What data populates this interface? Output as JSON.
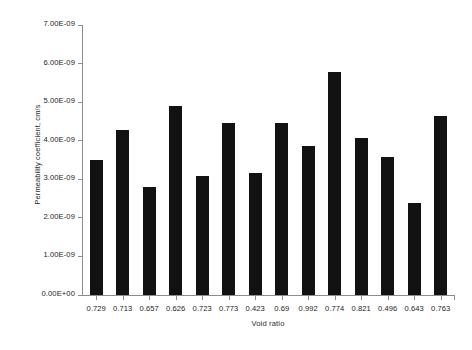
{
  "chart_data": {
    "type": "bar",
    "title": "",
    "xlabel": "Void ratio",
    "ylabel": "Permeability coefficient, cm/s",
    "categories": [
      "0.729",
      "0.713",
      "0.657",
      "0.626",
      "0.723",
      "0.773",
      "0.423",
      "0.69",
      "0.992",
      "0.774",
      "0.821",
      "0.496",
      "0.643",
      "0.763"
    ],
    "values": [
      3.49e-09,
      4.29e-09,
      2.79e-09,
      4.91e-09,
      3.08e-09,
      4.47e-09,
      3.17e-09,
      4.47e-09,
      3.87e-09,
      5.79e-09,
      4.08e-09,
      3.57e-09,
      2.38e-09,
      4.63e-09
    ],
    "ytick_labels": [
      "7.00E-09",
      "6.00E-09",
      "5.00E-09",
      "4.00E-09",
      "3.00E-09",
      "2.00E-09",
      "1.00E-09",
      "0.00E+00"
    ],
    "ytick_values": [
      7e-09,
      6e-09,
      5e-09,
      4e-09,
      3e-09,
      2e-09,
      1e-09,
      0
    ],
    "ylim": [
      0,
      7e-09
    ],
    "grid": false,
    "legend": false,
    "bar_color": "#121212",
    "axis_color": "#8d8d8d",
    "background": "#ffffff"
  },
  "caption": ""
}
